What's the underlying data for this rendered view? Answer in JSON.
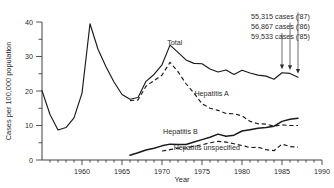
{
  "chart_data": {
    "type": "line",
    "title": "",
    "xlabel": "Year",
    "ylabel": "Cases per 100,000 population",
    "xlim": [
      1955,
      1990
    ],
    "ylim": [
      0,
      40
    ],
    "grid": false,
    "legend": "inline-labels",
    "x_ticks": [
      "1960",
      "1965",
      "1970",
      "1975",
      "1980",
      "1985",
      "1990"
    ],
    "x_tick_values": [
      1960,
      1965,
      1970,
      1975,
      1980,
      1985,
      1990
    ],
    "y_ticks": [
      "0",
      "10",
      "20",
      "30",
      "40"
    ],
    "y_tick_values": [
      0,
      10,
      20,
      30,
      40
    ],
    "y_minor_tick_values": [
      5,
      15,
      25,
      35
    ],
    "series": [
      {
        "name": "Total",
        "style": "solid",
        "label": "Total",
        "label_x": 1971.6,
        "label_y": 33.2,
        "x": [
          1955,
          1956,
          1957,
          1958,
          1959,
          1960,
          1961,
          1962,
          1963,
          1964,
          1965,
          1966,
          1967,
          1968,
          1969,
          1970,
          1971,
          1972,
          1973,
          1974,
          1975,
          1976,
          1977,
          1978,
          1979,
          1980,
          1981,
          1982,
          1983,
          1984,
          1985,
          1986,
          1987
        ],
        "values": [
          20.1,
          13.2,
          8.7,
          9.4,
          12.2,
          19.4,
          39.5,
          32.1,
          27.0,
          22.6,
          19.0,
          17.6,
          18.1,
          22.8,
          24.8,
          27.6,
          33.3,
          31.2,
          29.0,
          28.0,
          27.9,
          26.4,
          25.5,
          26.1,
          24.8,
          26.0,
          25.2,
          24.6,
          24.3,
          23.4,
          25.3,
          25.1,
          24.0
        ]
      },
      {
        "name": "Hepatitis A",
        "style": "dashed",
        "label": "Hepatitis A",
        "label_x": 1976.2,
        "label_y": 18.6,
        "x": [
          1966,
          1967,
          1968,
          1969,
          1970,
          1971,
          1972,
          1973,
          1974,
          1975,
          1976,
          1977,
          1978,
          1979,
          1980,
          1981,
          1982,
          1983,
          1984,
          1985,
          1986,
          1987
        ],
        "values": [
          17.2,
          17.4,
          21.4,
          23.0,
          24.6,
          28.3,
          25.6,
          22.1,
          19.4,
          16.3,
          15.0,
          14.4,
          13.5,
          13.4,
          12.8,
          11.2,
          10.5,
          10.4,
          9.8,
          10.2,
          10.0,
          10.0
        ]
      },
      {
        "name": "Hepatitis B",
        "style": "solid-thick",
        "label": "Hepatitis B",
        "label_x": 1972.3,
        "label_y": 7.6,
        "x": [
          1966,
          1967,
          1968,
          1969,
          1970,
          1971,
          1972,
          1973,
          1974,
          1975,
          1976,
          1977,
          1978,
          1979,
          1980,
          1981,
          1982,
          1983,
          1984,
          1985,
          1986,
          1987
        ],
        "values": [
          1.4,
          2.1,
          2.9,
          3.4,
          4.1,
          4.6,
          4.5,
          4.5,
          5.2,
          5.9,
          6.6,
          7.5,
          6.9,
          7.2,
          8.4,
          8.8,
          9.2,
          9.4,
          9.8,
          11.2,
          11.8,
          12.1
        ]
      },
      {
        "name": "Hepatitis unspecified",
        "style": "dashed",
        "label": "Hepatitis unspecified",
        "label_x": 1975.6,
        "label_y": 3.0,
        "x": [
          1970,
          1971,
          1972,
          1973,
          1974,
          1975,
          1976,
          1977,
          1978,
          1979,
          1980,
          1981,
          1982,
          1983,
          1984,
          1985,
          1986,
          1987
        ],
        "values": [
          2.6,
          3.0,
          3.4,
          3.5,
          4.0,
          4.4,
          5.0,
          5.4,
          5.2,
          4.7,
          4.2,
          3.6,
          3.7,
          3.0,
          2.7,
          4.6,
          3.9,
          3.7
        ]
      }
    ],
    "annotations": [
      {
        "text": "55,315 cases ('87)",
        "year": 1987,
        "value": 24.0
      },
      {
        "text": "56,867 cases ('86)",
        "year": 1986,
        "value": 25.1
      },
      {
        "text": "59,533 cases ('85)",
        "year": 1985,
        "value": 25.3
      }
    ]
  }
}
